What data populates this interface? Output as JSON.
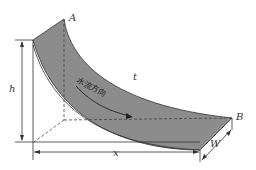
{
  "diagram": {
    "type": "3D open-channel flow surface (curved water sheet)",
    "labels": {
      "point_a": "A",
      "point_b": "B",
      "thickness": "t",
      "height": "h",
      "length": "x",
      "width": "W",
      "flow_direction": "水流方向"
    },
    "colors": {
      "surface_fill": "#8c8c8c",
      "line": "#333333",
      "background": "#ffffff"
    }
  }
}
